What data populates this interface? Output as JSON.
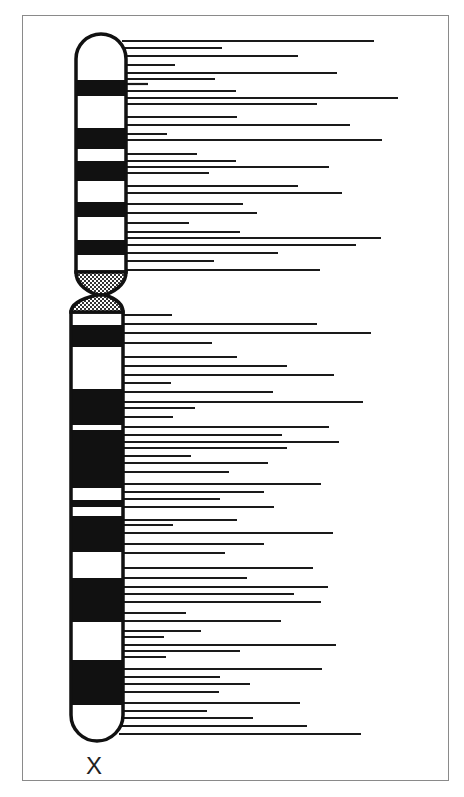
{
  "diagram": {
    "type": "chromosome-ideogram",
    "chromosome_label": "X",
    "colors": {
      "band_dark": "#111111",
      "band_light": "#ffffff",
      "outline": "#111111",
      "locus_line": "#1a1a1a",
      "frame": "#8a8a8a"
    },
    "p_arm": {
      "x_left": 76,
      "x_right": 126,
      "top": 34,
      "bands": [
        {
          "y0": 34,
          "y1": 80,
          "stain": "light"
        },
        {
          "y0": 80,
          "y1": 96,
          "stain": "dark"
        },
        {
          "y0": 96,
          "y1": 128,
          "stain": "light"
        },
        {
          "y0": 128,
          "y1": 149,
          "stain": "dark"
        },
        {
          "y0": 149,
          "y1": 161,
          "stain": "light"
        },
        {
          "y0": 161,
          "y1": 181,
          "stain": "dark"
        },
        {
          "y0": 181,
          "y1": 202,
          "stain": "light"
        },
        {
          "y0": 202,
          "y1": 217,
          "stain": "dark"
        },
        {
          "y0": 217,
          "y1": 240,
          "stain": "light"
        },
        {
          "y0": 240,
          "y1": 255,
          "stain": "dark"
        },
        {
          "y0": 255,
          "y1": 272,
          "stain": "light"
        }
      ]
    },
    "centromere": {
      "y_top": 272,
      "y_waist": 295,
      "y_bottom": 312,
      "pattern": "hatched"
    },
    "q_arm": {
      "x_left": 71,
      "x_right": 123,
      "bottom": 741,
      "bands": [
        {
          "y0": 312,
          "y1": 325,
          "stain": "light"
        },
        {
          "y0": 325,
          "y1": 347,
          "stain": "dark"
        },
        {
          "y0": 347,
          "y1": 389,
          "stain": "light"
        },
        {
          "y0": 389,
          "y1": 425,
          "stain": "dark"
        },
        {
          "y0": 425,
          "y1": 430,
          "stain": "light"
        },
        {
          "y0": 430,
          "y1": 488,
          "stain": "dark"
        },
        {
          "y0": 488,
          "y1": 500,
          "stain": "light"
        },
        {
          "y0": 500,
          "y1": 507,
          "stain": "dark"
        },
        {
          "y0": 507,
          "y1": 516,
          "stain": "light"
        },
        {
          "y0": 516,
          "y1": 552,
          "stain": "dark"
        },
        {
          "y0": 552,
          "y1": 578,
          "stain": "light"
        },
        {
          "y0": 578,
          "y1": 622,
          "stain": "dark"
        },
        {
          "y0": 622,
          "y1": 660,
          "stain": "light"
        },
        {
          "y0": 660,
          "y1": 705,
          "stain": "dark"
        },
        {
          "y0": 705,
          "y1": 741,
          "stain": "light"
        }
      ]
    },
    "locus_lines": [
      {
        "y": 41,
        "x_end": 374
      },
      {
        "y": 48,
        "x_end": 222
      },
      {
        "y": 56,
        "x_end": 298
      },
      {
        "y": 65,
        "x_end": 175
      },
      {
        "y": 73,
        "x_end": 337
      },
      {
        "y": 79,
        "x_end": 215
      },
      {
        "y": 84,
        "x_end": 148
      },
      {
        "y": 91,
        "x_end": 236
      },
      {
        "y": 98,
        "x_end": 398
      },
      {
        "y": 104,
        "x_end": 317
      },
      {
        "y": 117,
        "x_end": 237
      },
      {
        "y": 125,
        "x_end": 350
      },
      {
        "y": 134,
        "x_end": 167
      },
      {
        "y": 140,
        "x_end": 382
      },
      {
        "y": 154,
        "x_end": 197
      },
      {
        "y": 161,
        "x_end": 236
      },
      {
        "y": 167,
        "x_end": 329
      },
      {
        "y": 173,
        "x_end": 209
      },
      {
        "y": 186,
        "x_end": 298
      },
      {
        "y": 193,
        "x_end": 342
      },
      {
        "y": 204,
        "x_end": 243
      },
      {
        "y": 213,
        "x_end": 257
      },
      {
        "y": 223,
        "x_end": 189
      },
      {
        "y": 232,
        "x_end": 240
      },
      {
        "y": 238,
        "x_end": 381
      },
      {
        "y": 245,
        "x_end": 356
      },
      {
        "y": 253,
        "x_end": 278
      },
      {
        "y": 261,
        "x_end": 214
      },
      {
        "y": 270,
        "x_end": 320
      },
      {
        "y": 315,
        "x_end": 172
      },
      {
        "y": 324,
        "x_end": 317
      },
      {
        "y": 333,
        "x_end": 371
      },
      {
        "y": 343,
        "x_end": 212
      },
      {
        "y": 357,
        "x_end": 237
      },
      {
        "y": 366,
        "x_end": 287
      },
      {
        "y": 375,
        "x_end": 334
      },
      {
        "y": 383,
        "x_end": 171
      },
      {
        "y": 392,
        "x_end": 273
      },
      {
        "y": 402,
        "x_end": 363
      },
      {
        "y": 408,
        "x_end": 195
      },
      {
        "y": 417,
        "x_end": 173
      },
      {
        "y": 427,
        "x_end": 329
      },
      {
        "y": 435,
        "x_end": 282
      },
      {
        "y": 442,
        "x_end": 339
      },
      {
        "y": 448,
        "x_end": 287
      },
      {
        "y": 456,
        "x_end": 191
      },
      {
        "y": 463,
        "x_end": 268
      },
      {
        "y": 472,
        "x_end": 229
      },
      {
        "y": 484,
        "x_end": 321
      },
      {
        "y": 492,
        "x_end": 264
      },
      {
        "y": 499,
        "x_end": 220
      },
      {
        "y": 507,
        "x_end": 274
      },
      {
        "y": 520,
        "x_end": 237
      },
      {
        "y": 525,
        "x_end": 173
      },
      {
        "y": 533,
        "x_end": 333
      },
      {
        "y": 544,
        "x_end": 264
      },
      {
        "y": 553,
        "x_end": 225
      },
      {
        "y": 568,
        "x_end": 313
      },
      {
        "y": 578,
        "x_end": 247
      },
      {
        "y": 587,
        "x_end": 328
      },
      {
        "y": 594,
        "x_end": 294
      },
      {
        "y": 602,
        "x_end": 321
      },
      {
        "y": 613,
        "x_end": 186
      },
      {
        "y": 621,
        "x_end": 281
      },
      {
        "y": 631,
        "x_end": 201
      },
      {
        "y": 637,
        "x_end": 164
      },
      {
        "y": 645,
        "x_end": 336
      },
      {
        "y": 651,
        "x_end": 240
      },
      {
        "y": 657,
        "x_end": 166
      },
      {
        "y": 669,
        "x_end": 322
      },
      {
        "y": 677,
        "x_end": 220
      },
      {
        "y": 684,
        "x_end": 250
      },
      {
        "y": 692,
        "x_end": 219
      },
      {
        "y": 703,
        "x_end": 300
      },
      {
        "y": 711,
        "x_end": 207
      },
      {
        "y": 718,
        "x_end": 253
      },
      {
        "y": 726,
        "x_end": 307
      },
      {
        "y": 734,
        "x_end": 361
      }
    ]
  }
}
